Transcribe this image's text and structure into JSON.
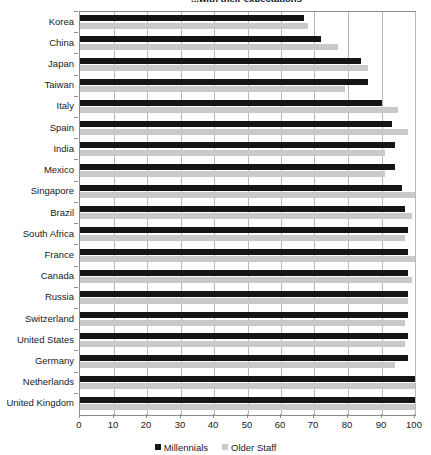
{
  "chart_data": {
    "type": "bar",
    "orientation": "horizontal",
    "title": "...with their expectations",
    "xlabel": "",
    "ylabel": "",
    "xlim": [
      0,
      100
    ],
    "xticks": [
      0,
      10,
      20,
      30,
      40,
      50,
      60,
      70,
      80,
      90,
      100
    ],
    "grid": true,
    "legend_position": "bottom",
    "categories": [
      "Korea",
      "China",
      "Japan",
      "Taiwan",
      "Italy",
      "Spain",
      "India",
      "Mexico",
      "Singapore",
      "Brazil",
      "South Africa",
      "France",
      "Canada",
      "Russia",
      "Switzerland",
      "United States",
      "Germany",
      "Netherlands",
      "United Kingdom"
    ],
    "series": [
      {
        "name": "Millennials",
        "color": "#151515",
        "values": [
          67,
          72,
          84,
          86,
          90,
          93,
          94,
          94,
          96,
          97,
          98,
          98,
          98,
          98,
          98,
          98,
          98,
          100,
          100
        ]
      },
      {
        "name": "Older Staff",
        "color": "#c9c9c9",
        "values": [
          68,
          77,
          86,
          79,
          95,
          98,
          91,
          91,
          100,
          99,
          97,
          100,
          99,
          98,
          97,
          97,
          94,
          100,
          100
        ]
      }
    ]
  },
  "legend": {
    "items": [
      {
        "label": "Millennials",
        "color": "#151515"
      },
      {
        "label": "Older Staff",
        "color": "#c9c9c9"
      }
    ]
  }
}
